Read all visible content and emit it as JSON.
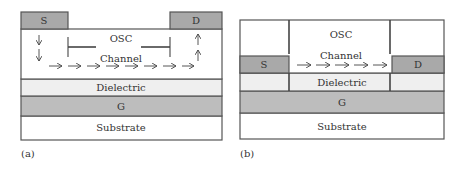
{
  "figure": {
    "panel_a": {
      "caption": "(a)",
      "layers": {
        "source": "S",
        "drain": "D",
        "osc": "OSC",
        "channel": "Channel",
        "dielectric": "Dielectric",
        "gate": "G",
        "substrate": "Substrate"
      },
      "arrows": {
        "source_down_count": 2,
        "channel_right_count": 8,
        "drain_up_count": 2
      }
    },
    "panel_b": {
      "caption": "(b)",
      "layers": {
        "source": "S",
        "drain": "D",
        "osc": "OSC",
        "channel": "Channel",
        "dielectric": "Dielectric",
        "gate": "G",
        "substrate": "Substrate"
      },
      "arrows": {
        "channel_right_count": 5
      }
    },
    "colors": {
      "electrode": "#a9a9a9",
      "gate": "#bdbdbd",
      "dielectric": "#efefef",
      "white": "#ffffff",
      "stroke": "#555555"
    }
  }
}
